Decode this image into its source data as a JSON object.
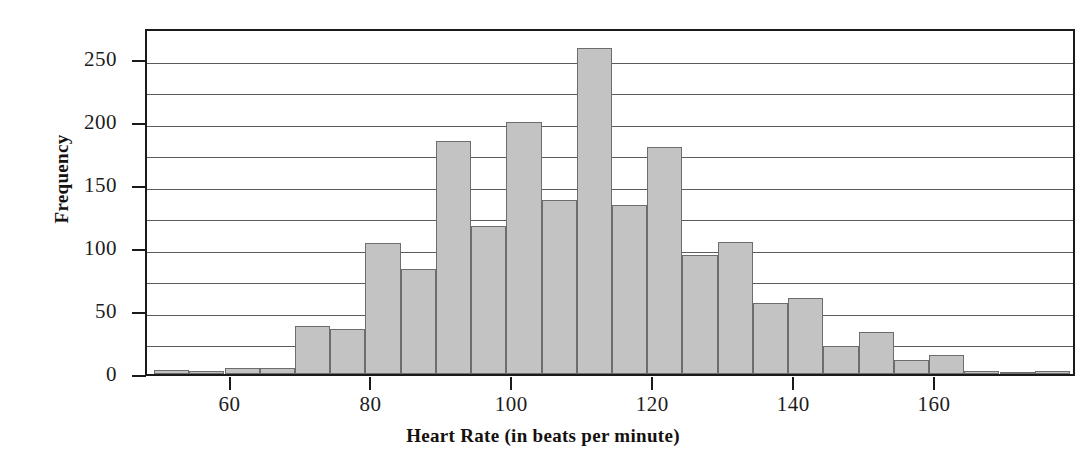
{
  "chart_data": {
    "type": "bar",
    "title": "",
    "subtitle": "",
    "xlabel": "Heart Rate (in beats per minute)",
    "ylabel": "Frequency",
    "xlim": [
      48,
      180
    ],
    "ylim": [
      0,
      275
    ],
    "bin_width": 5,
    "grid": "horizontal gridlines every 25 units",
    "legend": "none",
    "bar_color": "#c3c3c3",
    "bar_edge_color": "#6d6d6d",
    "axis_color": "#1a1a1a",
    "x_ticks": [
      60,
      80,
      100,
      120,
      140,
      160
    ],
    "x_tick_labels": [
      "60",
      "80",
      "100",
      "120",
      "140",
      "160"
    ],
    "y_ticks": [
      0,
      50,
      100,
      150,
      200,
      250
    ],
    "y_tick_labels": [
      "0",
      "50",
      "100",
      "150",
      "200",
      "250"
    ],
    "y_gridlines": [
      25,
      50,
      75,
      100,
      125,
      150,
      175,
      200,
      225,
      250
    ],
    "bin_starts": [
      49,
      54,
      59,
      64,
      69,
      74,
      79,
      84,
      89,
      94,
      99,
      104,
      109,
      114,
      119,
      124,
      129,
      134,
      139,
      144,
      149,
      154,
      159,
      164,
      169,
      174
    ],
    "categories": [
      "49-54",
      "54-59",
      "59-64",
      "64-69",
      "69-74",
      "74-79",
      "79-84",
      "84-89",
      "89-94",
      "94-99",
      "99-104",
      "104-109",
      "109-114",
      "114-119",
      "119-124",
      "124-129",
      "129-134",
      "134-139",
      "139-144",
      "144-149",
      "149-154",
      "154-159",
      "159-164",
      "164-169",
      "169-174",
      "174-179"
    ],
    "values": [
      3,
      2,
      5,
      5,
      38,
      36,
      104,
      83,
      185,
      117,
      200,
      138,
      258,
      134,
      180,
      94,
      105,
      56,
      60,
      22,
      33,
      11,
      15,
      2,
      1,
      2
    ],
    "max_value": 258,
    "max_category": "109-114"
  },
  "axes": {
    "y_title": "Frequency",
    "x_title": "Heart Rate (in beats per minute)"
  }
}
